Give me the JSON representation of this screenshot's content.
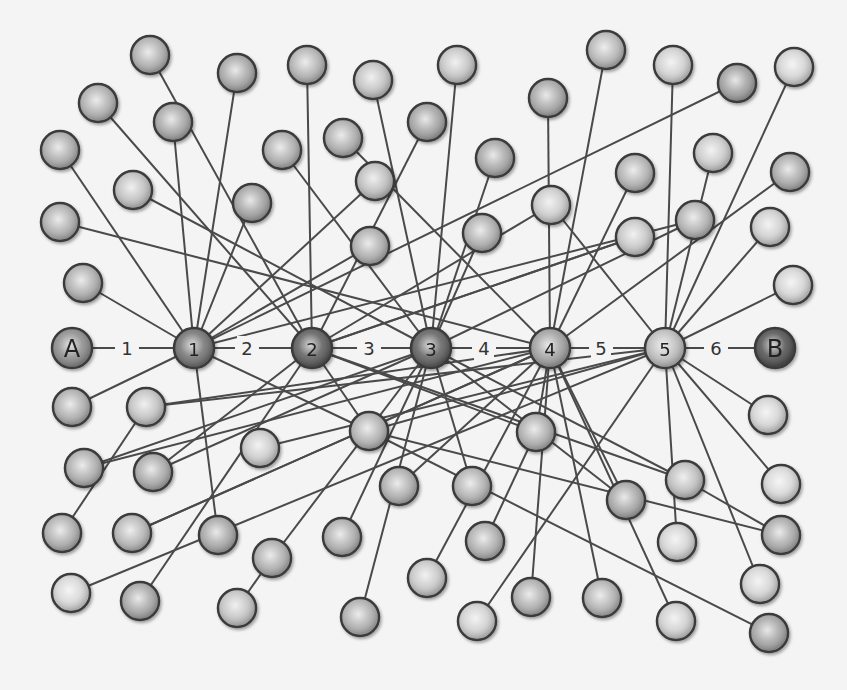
{
  "diagram": {
    "title": "",
    "node_radius": 19,
    "colors": {
      "background": "#f4f4f4",
      "edge": "#4a4a4a",
      "node_stroke": "#3b3b3b",
      "endpoint_a": "#8a8a8a",
      "endpoint_b": "#4e4e4e",
      "hub_dark": "#5a5a5a",
      "hub_mid": "#8c8c8c",
      "hub_light": "#bdbdbd",
      "leaf_mid": "#a8a8a8",
      "leaf_light": "#d8d8d8"
    },
    "chain": {
      "nodes": [
        {
          "id": "A",
          "label": "A",
          "x": 72,
          "y": 348,
          "fill": "#8a8a8a"
        },
        {
          "id": "1",
          "label": "1",
          "x": 194,
          "y": 348,
          "fill": "#707070"
        },
        {
          "id": "2",
          "label": "2",
          "x": 312,
          "y": 348,
          "fill": "#5a5a5a"
        },
        {
          "id": "3",
          "label": "3",
          "x": 431,
          "y": 348,
          "fill": "#5e5e5e"
        },
        {
          "id": "4",
          "label": "4",
          "x": 550,
          "y": 348,
          "fill": "#a0a0a0"
        },
        {
          "id": "5",
          "label": "5",
          "x": 665,
          "y": 348,
          "fill": "#bdbdbd"
        },
        {
          "id": "B",
          "label": "B",
          "x": 775,
          "y": 348,
          "fill": "#4e4e4e"
        }
      ],
      "hops": [
        {
          "label": "1",
          "x": 127,
          "y": 348
        },
        {
          "label": "2",
          "x": 247,
          "y": 348
        },
        {
          "label": "3",
          "x": 369,
          "y": 348
        },
        {
          "label": "4",
          "x": 484,
          "y": 348
        },
        {
          "label": "5",
          "x": 601,
          "y": 348
        },
        {
          "label": "6",
          "x": 716,
          "y": 348
        }
      ]
    },
    "leaves": [
      {
        "x": 150,
        "y": 55,
        "fill": "#b0b0b0",
        "to": "2"
      },
      {
        "x": 237,
        "y": 73,
        "fill": "#a8a8a8",
        "to": "1"
      },
      {
        "x": 307,
        "y": 65,
        "fill": "#b4b4b4",
        "to": "2"
      },
      {
        "x": 373,
        "y": 80,
        "fill": "#c4c4c4",
        "to": "3"
      },
      {
        "x": 98,
        "y": 103,
        "fill": "#b0b0b0",
        "to": "2"
      },
      {
        "x": 173,
        "y": 122,
        "fill": "#a8a8a8",
        "to": "1"
      },
      {
        "x": 60,
        "y": 150,
        "fill": "#aeaeae",
        "to": "1"
      },
      {
        "x": 282,
        "y": 150,
        "fill": "#b0b0b0",
        "to": "3"
      },
      {
        "x": 133,
        "y": 190,
        "fill": "#c2c2c2",
        "to": "3"
      },
      {
        "x": 252,
        "y": 203,
        "fill": "#a4a4a4",
        "to": "1"
      },
      {
        "x": 60,
        "y": 222,
        "fill": "#b0b0b0",
        "to": "4"
      },
      {
        "x": 343,
        "y": 138,
        "fill": "#b0b0b0",
        "to": "4"
      },
      {
        "x": 375,
        "y": 181,
        "fill": "#c0c0c0",
        "to": "1"
      },
      {
        "x": 427,
        "y": 122,
        "fill": "#a4a4a4",
        "to": "2"
      },
      {
        "x": 83,
        "y": 283,
        "fill": "#b0b0b0",
        "to": "1"
      },
      {
        "x": 370,
        "y": 246,
        "fill": "#b0b0b0",
        "to": "1"
      },
      {
        "x": 457,
        "y": 65,
        "fill": "#c6c6c6",
        "to": "3"
      },
      {
        "x": 548,
        "y": 98,
        "fill": "#a8a8a8",
        "to": "4"
      },
      {
        "x": 606,
        "y": 50,
        "fill": "#b8b8b8",
        "to": "4"
      },
      {
        "x": 673,
        "y": 65,
        "fill": "#d0d0d0",
        "to": "5"
      },
      {
        "x": 737,
        "y": 83,
        "fill": "#a0a0a0",
        "to": "1"
      },
      {
        "x": 794,
        "y": 67,
        "fill": "#d4d4d4",
        "to": "5"
      },
      {
        "x": 495,
        "y": 158,
        "fill": "#a8a8a8",
        "to": "3"
      },
      {
        "x": 635,
        "y": 173,
        "fill": "#b4b4b4",
        "to": "4"
      },
      {
        "x": 713,
        "y": 153,
        "fill": "#cccccc",
        "to": "5"
      },
      {
        "x": 790,
        "y": 172,
        "fill": "#ababab",
        "to": "4"
      },
      {
        "x": 482,
        "y": 233,
        "fill": "#b0b0b0",
        "to": "3"
      },
      {
        "x": 551,
        "y": 205,
        "fill": "#cccccc",
        "to": "5"
      },
      {
        "x": 635,
        "y": 237,
        "fill": "#c8c8c8",
        "to": "2"
      },
      {
        "x": 695,
        "y": 220,
        "fill": "#b4b4b4",
        "to": "3"
      },
      {
        "x": 770,
        "y": 227,
        "fill": "#cfcfcf",
        "to": "5"
      },
      {
        "x": 793,
        "y": 285,
        "fill": "#d4d4d4",
        "to": "5"
      },
      {
        "x": 72,
        "y": 407,
        "fill": "#b0b0b0",
        "to": "1"
      },
      {
        "x": 146,
        "y": 407,
        "fill": "#c4c4c4",
        "to": "4"
      },
      {
        "x": 84,
        "y": 468,
        "fill": "#b0b0b0",
        "to": "3"
      },
      {
        "x": 153,
        "y": 472,
        "fill": "#ababab",
        "to": "2"
      },
      {
        "x": 260,
        "y": 448,
        "fill": "#cccccc",
        "to": "5"
      },
      {
        "x": 369,
        "y": 431,
        "fill": "#b4b4b4",
        "to": "2"
      },
      {
        "x": 62,
        "y": 533,
        "fill": "#b0b0b0",
        "to": "146,407"
      },
      {
        "x": 132,
        "y": 533,
        "fill": "#b8b8b8",
        "to": "4"
      },
      {
        "x": 218,
        "y": 535,
        "fill": "#a8a8a8",
        "to": "1"
      },
      {
        "x": 272,
        "y": 558,
        "fill": "#b0b0b0",
        "to": "3"
      },
      {
        "x": 342,
        "y": 537,
        "fill": "#b0b0b0",
        "to": "3"
      },
      {
        "x": 399,
        "y": 486,
        "fill": "#b0b0b0",
        "to": "4"
      },
      {
        "x": 472,
        "y": 486,
        "fill": "#b4b4b4",
        "to": "3"
      },
      {
        "x": 360,
        "y": 617,
        "fill": "#b0b0b0",
        "to": "3"
      },
      {
        "x": 427,
        "y": 578,
        "fill": "#c8c8c8",
        "to": "4"
      },
      {
        "x": 71,
        "y": 593,
        "fill": "#d6d6d6",
        "to": "5"
      },
      {
        "x": 140,
        "y": 601,
        "fill": "#a8a8a8",
        "to": "2"
      },
      {
        "x": 237,
        "y": 608,
        "fill": "#c4c4c4",
        "to": "272,558"
      },
      {
        "x": 536,
        "y": 432,
        "fill": "#b0b0b0",
        "to": "4"
      },
      {
        "x": 626,
        "y": 500,
        "fill": "#a8a8a8",
        "to": "4"
      },
      {
        "x": 685,
        "y": 480,
        "fill": "#c0c0c0",
        "to": "3"
      },
      {
        "x": 477,
        "y": 621,
        "fill": "#d0d0d0",
        "to": "5"
      },
      {
        "x": 485,
        "y": 541,
        "fill": "#b0b0b0",
        "to": "536,432"
      },
      {
        "x": 531,
        "y": 597,
        "fill": "#b0b0b0",
        "to": "4"
      },
      {
        "x": 602,
        "y": 598,
        "fill": "#b4b4b4",
        "to": "4"
      },
      {
        "x": 677,
        "y": 542,
        "fill": "#d4d4d4",
        "to": "5"
      },
      {
        "x": 768,
        "y": 415,
        "fill": "#d4d4d4",
        "to": "5"
      },
      {
        "x": 781,
        "y": 484,
        "fill": "#d8d8d8",
        "to": "5"
      },
      {
        "x": 781,
        "y": 535,
        "fill": "#ababab",
        "to": "685,480"
      },
      {
        "x": 760,
        "y": 584,
        "fill": "#d4d4d4",
        "to": "5"
      },
      {
        "x": 676,
        "y": 621,
        "fill": "#d0d0d0",
        "to": "4"
      },
      {
        "x": 769,
        "y": 633,
        "fill": "#a4a4a4",
        "to": "369,431"
      }
    ],
    "extra_edges": [
      {
        "from": "1",
        "to": "695,220"
      },
      {
        "from": "2",
        "to": "551,205"
      },
      {
        "from": "2",
        "to": "635,237"
      },
      {
        "from": "1",
        "to": "369,431"
      },
      {
        "from": "2",
        "to": "536,432"
      },
      {
        "from": "3",
        "to": "153,472"
      },
      {
        "from": "4",
        "to": "84,468"
      },
      {
        "from": "5",
        "to": "146,407"
      },
      {
        "from": "5",
        "to": "369,431"
      },
      {
        "from": "4",
        "to": "132,533"
      },
      {
        "from": "2",
        "to": "685,480"
      },
      {
        "from": "3",
        "to": "626,500"
      },
      {
        "from": "369,431",
        "to": "781,535"
      }
    ]
  }
}
